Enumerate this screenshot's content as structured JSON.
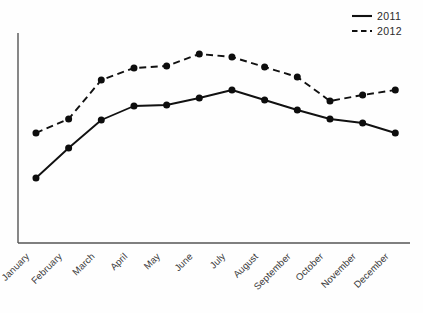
{
  "chart_data": {
    "type": "line",
    "title": "",
    "subtitle": "",
    "xlabel": "",
    "ylabel": "",
    "grid": false,
    "legend_position": "top-right",
    "categories": [
      "January",
      "February",
      "March",
      "April",
      "May",
      "June",
      "July",
      "August",
      "September",
      "October",
      "November",
      "December"
    ],
    "ylim": [
      0,
      210
    ],
    "series": [
      {
        "name": "2011",
        "line_style": "solid",
        "marker": "circle",
        "values": [
          65,
          95,
          123,
          137,
          138,
          145,
          153,
          143,
          133,
          124,
          120,
          110
        ]
      },
      {
        "name": "2012",
        "line_style": "dashed",
        "marker": "circle",
        "values": [
          110,
          124,
          163,
          175,
          177,
          189,
          186,
          176,
          166,
          142,
          148,
          153
        ]
      }
    ]
  },
  "legend": {
    "items": [
      {
        "label": "2011",
        "style": "solid"
      },
      {
        "label": "2012",
        "style": "dashed"
      }
    ]
  },
  "axes": {
    "y_axis_visible": true,
    "x_axis_visible": true,
    "y_tick_labels": [],
    "x_tick_label_rotation": "-45"
  }
}
